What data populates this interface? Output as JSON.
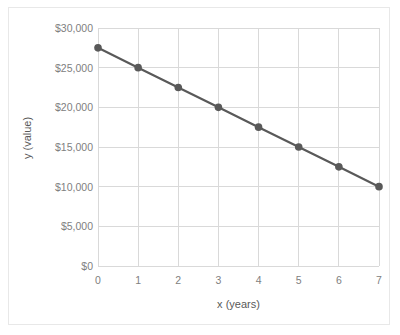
{
  "chart_data": {
    "type": "line",
    "title": "",
    "xlabel": "x (years)",
    "ylabel": "y (value)",
    "x": [
      0,
      1,
      2,
      3,
      4,
      5,
      6,
      7
    ],
    "values": [
      27500,
      25000,
      22500,
      20000,
      17500,
      15000,
      12500,
      10000
    ],
    "series": [
      {
        "name": "value",
        "values": [
          27500,
          25000,
          22500,
          20000,
          17500,
          15000,
          12500,
          10000
        ]
      }
    ],
    "xlim": [
      0,
      7
    ],
    "ylim": [
      0,
      30000
    ],
    "xticks": [
      "0",
      "1",
      "2",
      "3",
      "4",
      "5",
      "6",
      "7"
    ],
    "yticks": [
      "$0",
      "$5,000",
      "$10,000",
      "$15,000",
      "$20,000",
      "$25,000",
      "$30,000"
    ],
    "ytick_values": [
      0,
      5000,
      10000,
      15000,
      20000,
      25000,
      30000
    ],
    "grid": true,
    "legend": false,
    "legend_position": "none",
    "marker": "circle",
    "colors": {
      "line": "#595959",
      "marker": "#595959",
      "grid": "#d9d9d9",
      "axis_text": "#808080",
      "title_text": "#595959",
      "border": "#e8e8e8",
      "background": "#ffffff"
    }
  }
}
